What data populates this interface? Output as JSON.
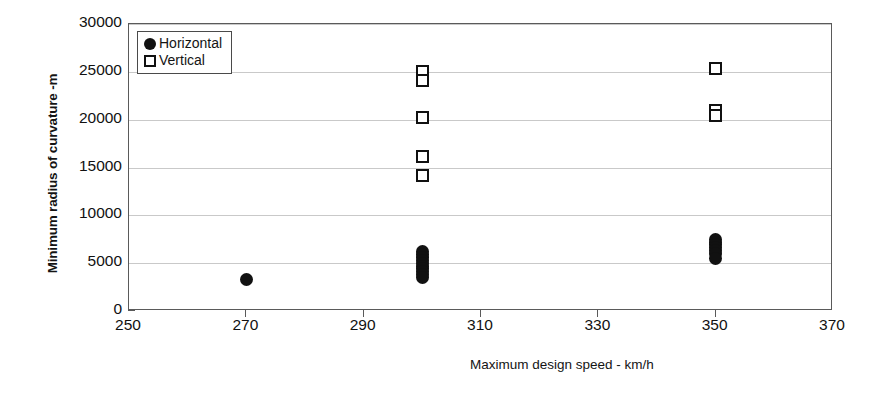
{
  "chart_data": {
    "type": "scatter",
    "title": "",
    "xlabel": "Maximum design speed - km/h",
    "ylabel": "Minimum radius of curvature -m",
    "xlim": [
      250,
      370
    ],
    "ylim": [
      0,
      30000
    ],
    "xticks": [
      250,
      270,
      290,
      310,
      330,
      350,
      370
    ],
    "yticks": [
      0,
      5000,
      10000,
      15000,
      20000,
      25000,
      30000
    ],
    "grid": "horizontal",
    "legend_position": "top-left",
    "series": [
      {
        "name": "Horizontal",
        "marker": "filled-circle",
        "color": "#111111",
        "points": [
          {
            "x": 270,
            "y": 3300
          },
          {
            "x": 300,
            "y": 6200
          },
          {
            "x": 300,
            "y": 5900
          },
          {
            "x": 300,
            "y": 5600
          },
          {
            "x": 300,
            "y": 5300
          },
          {
            "x": 300,
            "y": 5000
          },
          {
            "x": 300,
            "y": 4700
          },
          {
            "x": 300,
            "y": 4400
          },
          {
            "x": 300,
            "y": 4100
          },
          {
            "x": 300,
            "y": 3800
          },
          {
            "x": 300,
            "y": 3500
          },
          {
            "x": 350,
            "y": 7500
          },
          {
            "x": 350,
            "y": 7200
          },
          {
            "x": 350,
            "y": 6900
          },
          {
            "x": 350,
            "y": 6600
          },
          {
            "x": 350,
            "y": 6300
          },
          {
            "x": 350,
            "y": 6000
          },
          {
            "x": 350,
            "y": 5500
          }
        ]
      },
      {
        "name": "Vertical",
        "marker": "open-square",
        "color": "#111111",
        "points": [
          {
            "x": 300,
            "y": 25000
          },
          {
            "x": 300,
            "y": 24100
          },
          {
            "x": 300,
            "y": 20200
          },
          {
            "x": 300,
            "y": 16200
          },
          {
            "x": 300,
            "y": 14200
          },
          {
            "x": 350,
            "y": 25400
          },
          {
            "x": 350,
            "y": 21000
          },
          {
            "x": 350,
            "y": 20400
          }
        ]
      }
    ]
  },
  "legend": {
    "items": [
      {
        "label": "Horizontal",
        "marker": "filled-circle"
      },
      {
        "label": "Vertical",
        "marker": "open-square"
      }
    ]
  }
}
